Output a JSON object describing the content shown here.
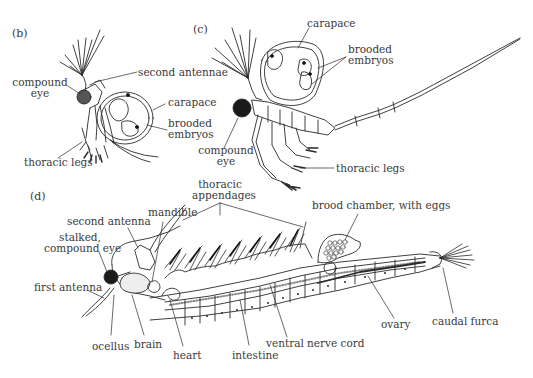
{
  "figure": {
    "panels": {
      "b": {
        "letter": "(b)",
        "labels": {
          "second_antennae": "second antennae",
          "compound_eye_1": "compound",
          "compound_eye_2": "eye",
          "carapace": "carapace",
          "brooded_embryos_1": "brooded",
          "brooded_embryos_2": "embryos",
          "thoracic_legs": "thoracic legs"
        }
      },
      "c": {
        "letter": "(c)",
        "labels": {
          "carapace": "carapace",
          "brooded_embryos_1": "brooded",
          "brooded_embryos_2": "embryos",
          "compound_eye_1": "compound",
          "compound_eye_2": "eye",
          "thoracic_legs": "thoracic legs"
        }
      },
      "d": {
        "letter": "(d)",
        "labels": {
          "thoracic_appendages_1": "thoracic",
          "thoracic_appendages_2": "appendages",
          "mandible": "mandible",
          "second_antenna": "second antenna",
          "stalked_eye_1": "stalked,",
          "stalked_eye_2": "compound eye",
          "first_antenna": "first antenna",
          "ocellus": "ocellus",
          "brain": "brain",
          "heart": "heart",
          "intestine": "intestine",
          "ventral_nerve_cord": "ventral nerve cord",
          "brood_chamber": "brood chamber, with eggs",
          "ovary": "ovary",
          "caudal_furca": "caudal furca"
        }
      }
    },
    "colors": {
      "ink": "#2a2a2a",
      "text": "#3a3a3a",
      "background": "#ffffff"
    }
  }
}
